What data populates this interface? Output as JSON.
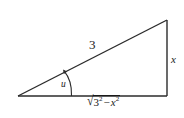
{
  "figure": {
    "kind": "right-triangle-diagram",
    "background_color": "#ffffff",
    "stroke_color": "#2b2b2b",
    "text_color": "#1a1a1a",
    "vertices": {
      "left": [
        18,
        96
      ],
      "bottom_right": [
        167,
        96
      ],
      "top_right": [
        167,
        20
      ]
    },
    "labels": {
      "hypotenuse": "3",
      "opposite_side": "x",
      "angle": "u",
      "base_radical_sign": "√",
      "base_radicand_first_base": "3",
      "base_radicand_first_exponent": "2",
      "base_radicand_operator": "−",
      "base_radicand_second_base": "x",
      "base_radicand_second_exponent": "2",
      "base_full_text": "√(3² − x²)"
    }
  }
}
